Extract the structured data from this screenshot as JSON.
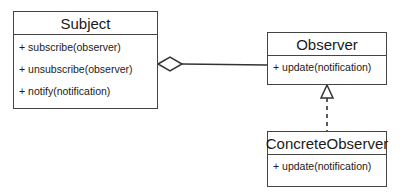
{
  "diagram": {
    "type": "UML class diagram",
    "pattern": "Observer",
    "classes": [
      {
        "name": "Subject",
        "operations": [
          "+ subscribe(observer)",
          "+ unsubscribe(observer)",
          "+ notify(notification)"
        ]
      },
      {
        "name": "Observer",
        "operations": [
          "+ update(notification)"
        ]
      },
      {
        "name": "ConcreteObserver",
        "operations": [
          "+ update(notification)"
        ]
      }
    ],
    "relationships": [
      {
        "from": "Subject",
        "to": "Observer",
        "kind": "aggregation",
        "marker": "hollow-diamond"
      },
      {
        "from": "ConcreteObserver",
        "to": "Observer",
        "kind": "realization",
        "marker": "hollow-triangle",
        "line": "dashed"
      }
    ],
    "colors": {
      "line": "#444444",
      "text": "#1a1a1a",
      "background": "#ffffff"
    }
  }
}
